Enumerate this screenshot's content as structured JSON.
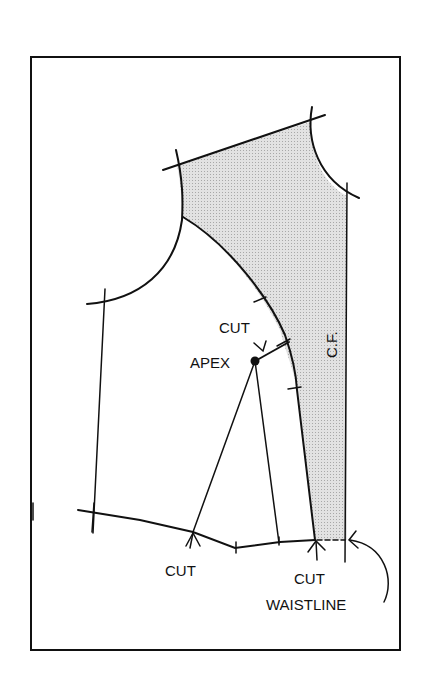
{
  "diagram": {
    "type": "bodice-front-pattern",
    "labels": {
      "cut_top": "CUT",
      "apex": "APEX",
      "cf": "C.F.",
      "cut_left": "CUT",
      "cut_right": "CUT",
      "waistline": "WAISTLINE"
    },
    "colors": {
      "line": "#111111",
      "shade": "#d4d4d4",
      "background": "#ffffff"
    }
  }
}
